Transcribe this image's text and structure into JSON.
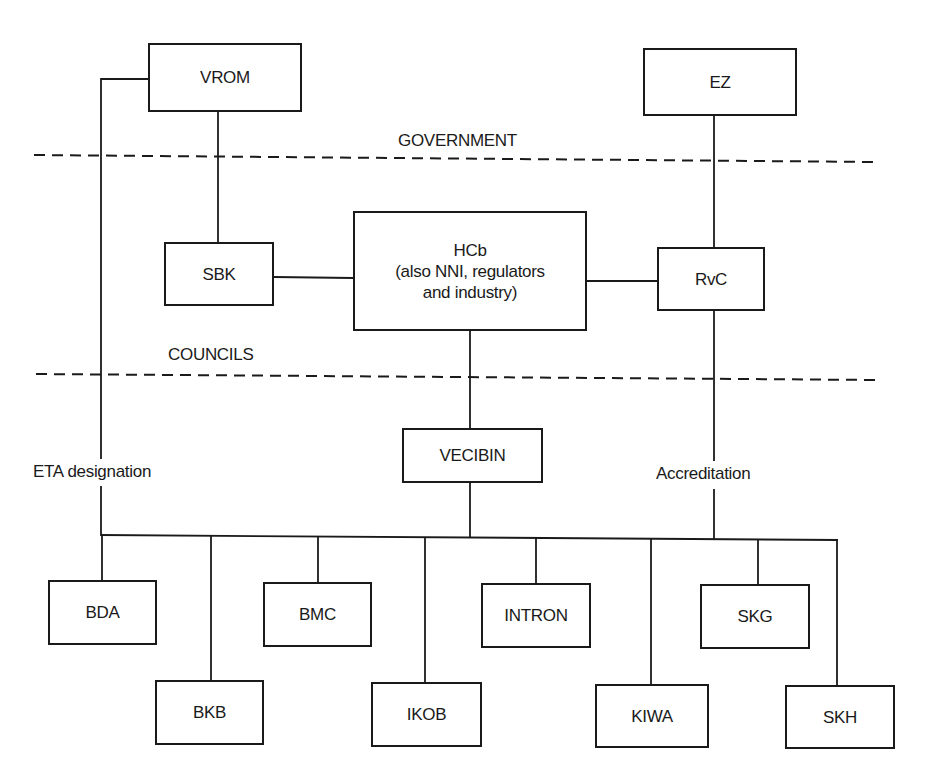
{
  "diagram": {
    "type": "organization-chart",
    "zones": {
      "government": "GOVERNMENT",
      "councils": "COUNCILS"
    },
    "nodes": {
      "vrom": "VROM",
      "ez": "EZ",
      "sbk": "SBK",
      "hcb": {
        "line1": "HCb",
        "line2": "(also NNI, regulators",
        "line3": "and industry)"
      },
      "rvc": "RvC",
      "vecibin": "VECIBIN",
      "bda": "BDA",
      "bkb": "BKB",
      "bmc": "BMC",
      "ikob": "IKOB",
      "intron": "INTRON",
      "kiwa": "KIWA",
      "skg": "SKG",
      "skh": "SKH"
    },
    "edge_labels": {
      "eta": "ETA designation",
      "accreditation": "Accreditation"
    },
    "edges": [
      {
        "from": "VROM",
        "to": "SBK"
      },
      {
        "from": "VROM",
        "to": "certification-bodies",
        "label": "ETA designation"
      },
      {
        "from": "EZ",
        "to": "RvC"
      },
      {
        "from": "SBK",
        "to": "HCb"
      },
      {
        "from": "HCb",
        "to": "RvC"
      },
      {
        "from": "HCb",
        "to": "VECIBIN"
      },
      {
        "from": "VECIBIN",
        "to": "certification-bodies"
      },
      {
        "from": "RvC",
        "to": "certification-bodies",
        "label": "Accreditation"
      }
    ],
    "certification_bodies": [
      "BDA",
      "BKB",
      "BMC",
      "IKOB",
      "INTRON",
      "KIWA",
      "SKG",
      "SKH"
    ]
  }
}
